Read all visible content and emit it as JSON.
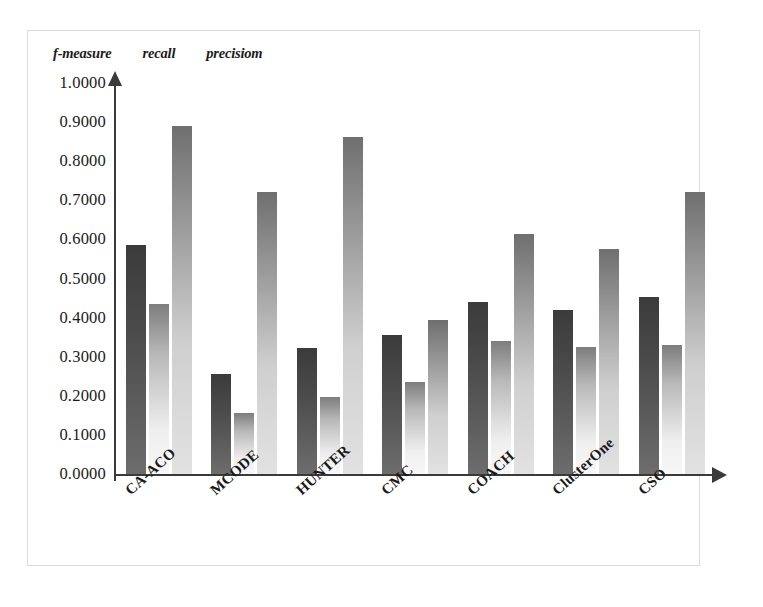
{
  "chart_data": {
    "type": "bar",
    "title": "",
    "subtitle": "",
    "xlabel": "",
    "ylabel": "",
    "ylim": [
      0,
      1.0
    ],
    "grid": false,
    "legend_position": "top-left",
    "ytick_labels": [
      "1.0000",
      "0.9000",
      "0.8000",
      "0.7000",
      "0.6000",
      "0.5000",
      "0.4000",
      "0.3000",
      "0.2000",
      "0.1000",
      "0.0000"
    ],
    "ytick_values": [
      1.0,
      0.9,
      0.8,
      0.7,
      0.6,
      0.5,
      0.4,
      0.3,
      0.2,
      0.1,
      0.0
    ],
    "categories": [
      "CA-ACO",
      "MCODE",
      "HUNTER",
      "CMC",
      "COACH",
      "ClusterOne",
      "CSO"
    ],
    "series": [
      {
        "name": "f-measure",
        "color": "#4a4a4a",
        "values": [
          0.585,
          0.255,
          0.322,
          0.355,
          0.44,
          0.42,
          0.452
        ]
      },
      {
        "name": "recall",
        "color": "#e0e0e0",
        "values": [
          0.435,
          0.155,
          0.198,
          0.235,
          0.34,
          0.325,
          0.33
        ]
      },
      {
        "name": "precisiom",
        "color": "#b5b5b5",
        "values": [
          0.89,
          0.72,
          0.862,
          0.395,
          0.615,
          0.575,
          0.72
        ]
      }
    ]
  },
  "legend": {
    "items": [
      {
        "label": "f-measure",
        "swatch": "series-0-swatch"
      },
      {
        "label": "recall",
        "swatch": "series-1-swatch"
      },
      {
        "label": "precisiom",
        "swatch": "series-2-swatch"
      }
    ]
  },
  "colors": {
    "axis": "#3a3a3a",
    "frame": "#dcdcdc",
    "background": "#ffffff"
  }
}
